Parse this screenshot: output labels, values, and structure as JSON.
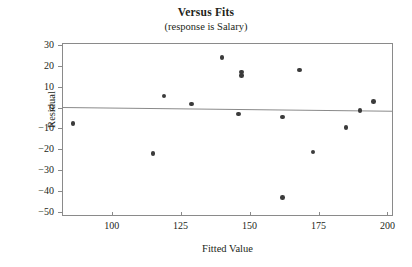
{
  "chart_data": {
    "type": "scatter",
    "title": "Versus Fits",
    "subtitle": "(response is Salary)",
    "xlabel": "Fitted Value",
    "ylabel": "Residual",
    "xlim": [
      82,
      202
    ],
    "ylim": [
      -52,
      31
    ],
    "xticks": [
      100,
      125,
      150,
      175,
      200
    ],
    "yticks": [
      30,
      20,
      10,
      0,
      -10,
      -20,
      -30,
      -40,
      -50
    ],
    "xticklabels": [
      "100",
      "125",
      "150",
      "175",
      "200"
    ],
    "yticklabels": [
      "30",
      "20",
      "10",
      "0",
      "-10",
      "-20",
      "-30",
      "-40",
      "-50"
    ],
    "grid": false,
    "legend": null,
    "marker": "filled-circle",
    "marker_color": "#3b3b3b",
    "frame_color": "#8a8a8a",
    "reference_line": {
      "label": "zero-residual-line",
      "y_at_xmin": 0.2,
      "y_at_xmax": -1.6,
      "color": "#8a8a8a"
    },
    "points": [
      {
        "x": 86,
        "y": -7.7
      },
      {
        "x": 115,
        "y": -22.0
      },
      {
        "x": 119,
        "y": 5.5
      },
      {
        "x": 129,
        "y": 1.8
      },
      {
        "x": 140,
        "y": 24.0
      },
      {
        "x": 146,
        "y": -3.0
      },
      {
        "x": 147,
        "y": 17.0
      },
      {
        "x": 147,
        "y": 15.3
      },
      {
        "x": 162,
        "y": -4.5
      },
      {
        "x": 162,
        "y": -43.0
      },
      {
        "x": 168,
        "y": 18.0
      },
      {
        "x": 173,
        "y": -21.3
      },
      {
        "x": 185,
        "y": -9.5
      },
      {
        "x": 190,
        "y": -1.3
      },
      {
        "x": 195,
        "y": 3.0
      }
    ]
  }
}
